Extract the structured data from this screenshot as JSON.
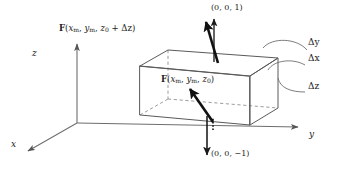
{
  "figure": {
    "background_color": "#ffffff",
    "ink_color": "#1a1a1a",
    "width": 340,
    "height": 170
  },
  "axes": {
    "origin": {
      "x": 77,
      "y": 123
    },
    "items": [
      {
        "name": "z",
        "label": "z",
        "label_x": 34,
        "label_y": 54,
        "tip_x": 77,
        "tip_y": 42
      },
      {
        "name": "y",
        "label": "y",
        "label_x": 310,
        "label_y": 135,
        "tip_x": 300,
        "tip_y": 126
      },
      {
        "name": "x",
        "label": "x",
        "label_x": 12,
        "label_y": 145,
        "tip_x": 26,
        "tip_y": 152
      }
    ]
  },
  "box": {
    "name": "rectangular-control-volume",
    "front_bottom_left": {
      "x": 140,
      "y": 115
    },
    "front_bottom_right": {
      "x": 250,
      "y": 125
    },
    "front_top_left": {
      "x": 140,
      "y": 66
    },
    "front_top_right": {
      "x": 250,
      "y": 76
    },
    "back_bottom_left": {
      "x": 168,
      "y": 99
    },
    "back_bottom_right": {
      "x": 278,
      "y": 108
    },
    "back_top_left": {
      "x": 168,
      "y": 50
    },
    "back_top_right": {
      "x": 278,
      "y": 58
    }
  },
  "vectors": {
    "top_field": {
      "name": "field-vector-top-face",
      "label": "F(x_m, y_m, z_0 + Δz)",
      "label_x": 60,
      "label_y": 28,
      "tail": {
        "x": 218,
        "y": 63
      },
      "head": {
        "x": 205,
        "y": 20
      }
    },
    "top_normal": {
      "name": "unit-normal-top",
      "label": "(0, 0, 1)",
      "label_x": 212,
      "label_y": 5,
      "tail": {
        "x": 214,
        "y": 62
      },
      "head": {
        "x": 214,
        "y": 18
      }
    },
    "bottom_field": {
      "name": "field-vector-bottom-face",
      "label": "F(x_m, y_m, z_0)",
      "label_x": 162,
      "label_y": 78,
      "tail": {
        "x": 213,
        "y": 122
      },
      "head": {
        "x": 189,
        "y": 88
      }
    },
    "bottom_normal": {
      "name": "unit-normal-bottom",
      "label": "(0, 0, −1)",
      "label_x": 212,
      "label_y": 152,
      "tail": {
        "x": 207,
        "y": 118
      },
      "head": {
        "x": 207,
        "y": 156
      }
    }
  },
  "dimensions": [
    {
      "name": "delta-y",
      "label": "Δy",
      "label_x": 308,
      "label_y": 42,
      "leader": "M 307 50 C 297 38, 272 37, 263 48"
    },
    {
      "name": "delta-x",
      "label": "Δx",
      "label_x": 308,
      "label_y": 57,
      "leader": "M 305 65 C 293 58, 274 60, 268 70"
    },
    {
      "name": "delta-z",
      "label": "Δz",
      "label_x": 308,
      "label_y": 85,
      "leader": "M 305 92 C 291 92, 280 88, 278 78"
    }
  ],
  "labels": {
    "F_symbol": "F",
    "x_m": "x",
    "y_m": "y",
    "z_0": "z",
    "sub_m": "m",
    "sub_0": "0",
    "delta_z_term": "+ Δz",
    "open_paren": "(",
    "close_paren": ")",
    "comma": ", "
  }
}
